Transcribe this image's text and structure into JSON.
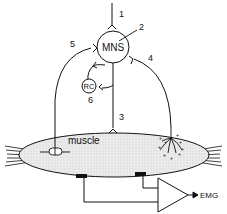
{
  "diagram": {
    "nodes": {
      "mns": "MNS",
      "rc": "RC",
      "muscle": "muscle",
      "output": "EMG"
    },
    "pathway_labels": [
      "1",
      "2",
      "3",
      "4",
      "5",
      "6"
    ],
    "colors": {
      "line": "#111111",
      "muscle_fill": "#e6e6e6",
      "background": "#ffffff"
    }
  }
}
